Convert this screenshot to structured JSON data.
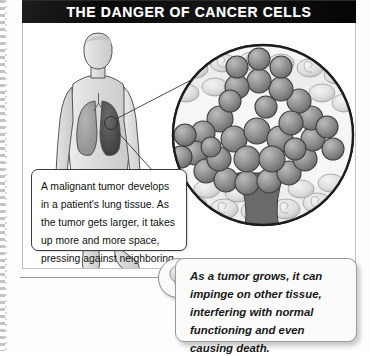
{
  "page": {
    "title": "THE DANGER OF CANCER CELLS",
    "background_color": "#ffffff",
    "title_bar_color": "#131313",
    "title_text_color": "#ffffff"
  },
  "diagram": {
    "figure_label": "human-body-anatomy-lungs",
    "magnifier_label": "magnified-lung-tissue-tumor-cells",
    "tumor_marker_label": "tumor-site-marker",
    "colors": {
      "skin": "#dcdcdc",
      "lung_healthy": "#9c9c9c",
      "lung_affected": "#4a4a4a",
      "cancer_cell": "#8e8e8e",
      "normal_cell": "#e2e2e2",
      "outline": "#2a2a2a"
    }
  },
  "callout": {
    "text": "A malignant tumor develops in a patient's lung tissue. As the tumor gets larger, it takes up more and more space, pressing against neighboring cells and tissue."
  },
  "tip": {
    "icon": "lightbulb-icon",
    "text": "As a tumor grows, it can impinge on other tissue, interfering with normal functioning and even causing death."
  }
}
